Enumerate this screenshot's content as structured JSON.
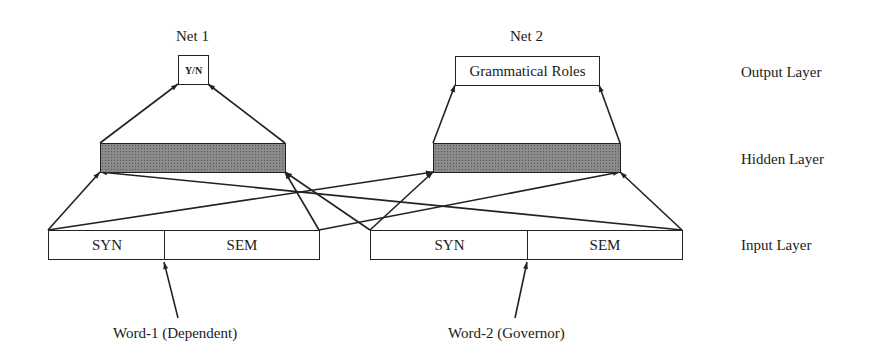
{
  "nets": [
    {
      "title": "Net 1",
      "output_label": "Y/N"
    },
    {
      "title": "Net 2",
      "output_label": "Grammatical Roles"
    }
  ],
  "layers": {
    "output": "Output Layer",
    "hidden": "Hidden Layer",
    "input": "Input Layer"
  },
  "inputs": [
    {
      "cells": [
        "SYN",
        "SEM"
      ],
      "word_label": "Word-1 (Dependent)"
    },
    {
      "cells": [
        "SYN",
        "SEM"
      ],
      "word_label": "Word-2 (Governor)"
    }
  ],
  "colors": {
    "line": "#222222",
    "hidden_fill": "#8a8a8a",
    "background": "#ffffff"
  }
}
